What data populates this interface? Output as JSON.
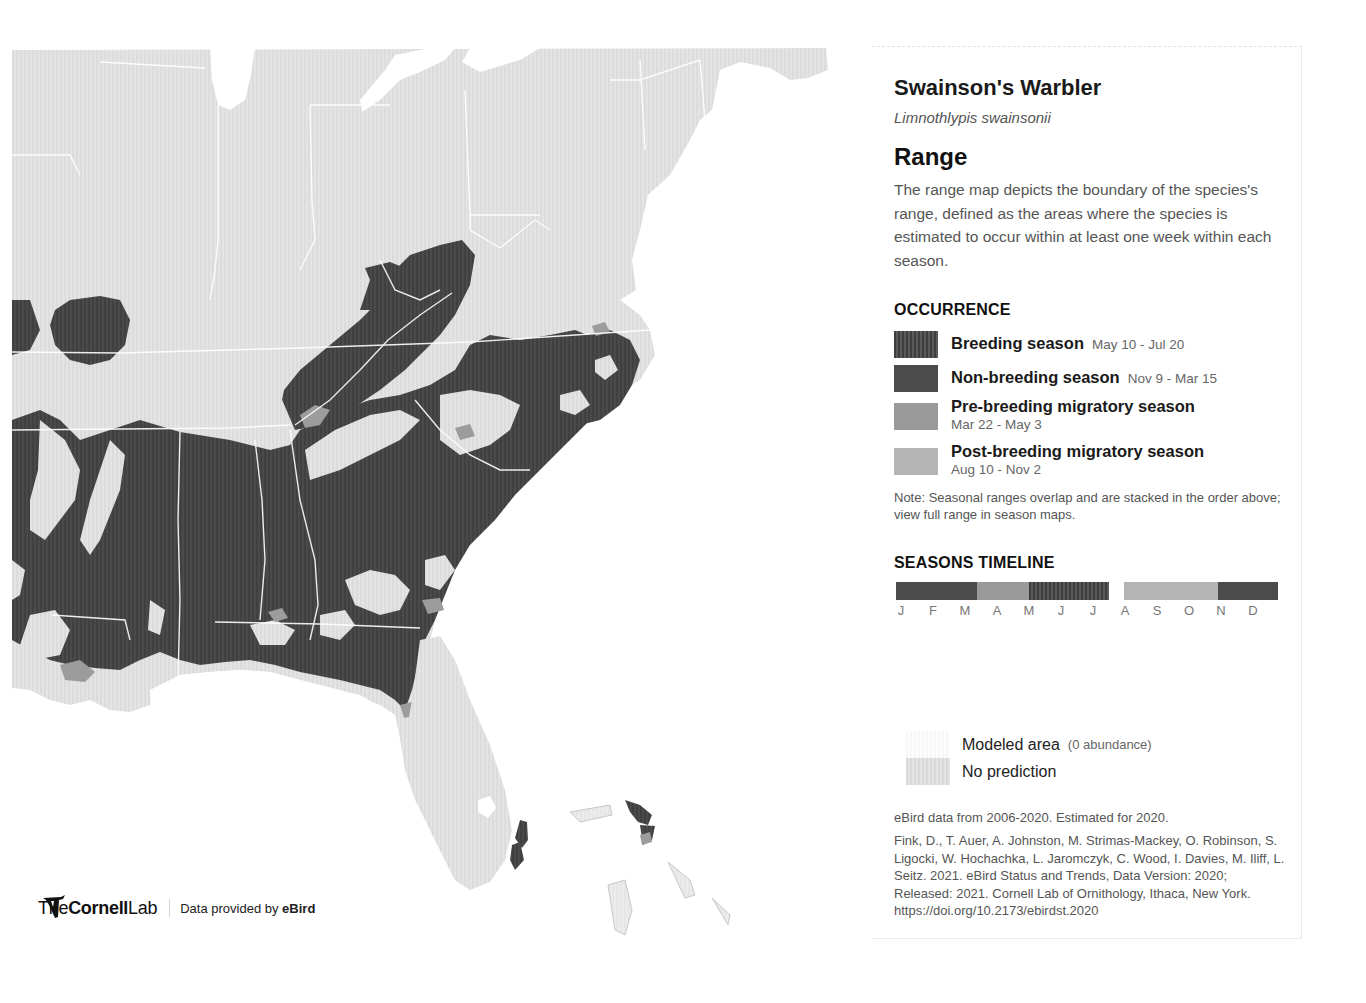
{
  "map": {
    "region": "Eastern United States",
    "colors": {
      "land_modeled": "#e2e2e2",
      "water": "#ffffff",
      "breeding": "#444444",
      "nonbreeding": "#4b4b4b",
      "pre_breeding": "#9a9a9a",
      "post_breeding": "#b4b4b4",
      "state_border": "#ffffff"
    }
  },
  "credits": {
    "logo_the": "The",
    "logo_cornell": "Cornell",
    "logo_lab": "Lab",
    "data_provided_prefix": "Data provided by ",
    "data_provided_brand": "eBird"
  },
  "panel": {
    "species_name": "Swainson's Warbler",
    "scientific_name": "Limnothlypis swainsonii",
    "section_title": "Range",
    "description": "The range map depicts the boundary of the species's range, defined as the areas where the species is estimated to occur within at least one week within each season.",
    "occurrence": {
      "title": "OCCURRENCE",
      "items": [
        {
          "label": "Breeding season",
          "dates": "May 10 - Jul 20",
          "color": "#444444"
        },
        {
          "label": "Non-breeding season",
          "dates": "Nov 9 - Mar 15",
          "color": "#4b4b4b"
        },
        {
          "label": "Pre-breeding migratory season",
          "dates": "Mar 22 - May 3",
          "color": "#9a9a9a"
        },
        {
          "label": "Post-breeding migratory season",
          "dates": "Aug 10 - Nov 2",
          "color": "#b4b4b4"
        }
      ],
      "note": "Note: Seasonal ranges overlap and are stacked in the order above; view full range in season maps."
    },
    "timeline": {
      "title": "SEASONS TIMELINE",
      "months": [
        "J",
        "F",
        "M",
        "A",
        "M",
        "J",
        "J",
        "A",
        "S",
        "O",
        "N",
        "D"
      ],
      "segments": [
        {
          "season": "Non-breeding",
          "start": "Jan 1",
          "end": "Mar 15"
        },
        {
          "season": "Pre-breeding",
          "start": "Mar 22",
          "end": "May 3"
        },
        {
          "season": "Breeding",
          "start": "May 10",
          "end": "Jul 20"
        },
        {
          "season": "Post-breeding",
          "start": "Aug 10",
          "end": "Nov 2"
        },
        {
          "season": "Non-breeding",
          "start": "Nov 9",
          "end": "Dec 31"
        }
      ]
    },
    "model_legend": {
      "modeled_label": "Modeled area",
      "modeled_sub": "(0 abundance)",
      "no_prediction_label": "No prediction"
    },
    "data_years": "eBird data from 2006-2020. Estimated for 2020.",
    "citation": "Fink, D., T. Auer, A. Johnston, M. Strimas-Mackey, O. Robinson, S. Ligocki, W. Hochachka, L. Jaromczyk, C. Wood, I. Davies, M. Iliff, L. Seitz. 2021. eBird Status and Trends, Data Version: 2020; Released: 2021. Cornell Lab of Ornithology, Ithaca, New York. https://doi.org/10.2173/ebirdst.2020"
  }
}
